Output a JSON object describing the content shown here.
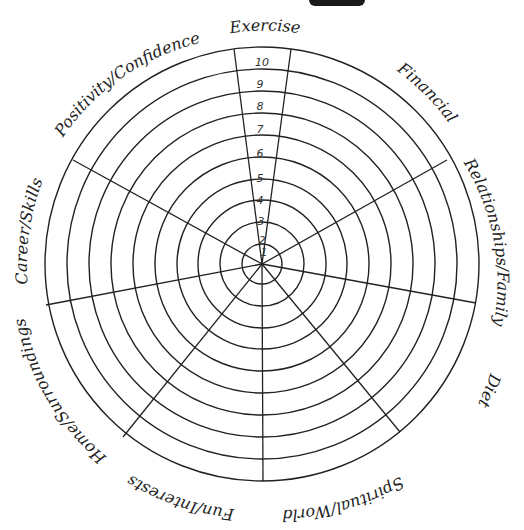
{
  "diagram": {
    "type": "wheel-of-life",
    "center": {
      "x": 262,
      "y": 264
    },
    "outer_radius": 217,
    "ring_count": 10,
    "scale_labels": [
      "1",
      "2",
      "3",
      "4",
      "5",
      "6",
      "7",
      "8",
      "9",
      "10"
    ],
    "categories": [
      {
        "label": "Exercise"
      },
      {
        "label": "Financial"
      },
      {
        "label": "Relationships/Family"
      },
      {
        "label": "Diet"
      },
      {
        "label": "Spiritual/World"
      },
      {
        "label": "Fun/Interests"
      },
      {
        "label": "Home/Surroundings"
      },
      {
        "label": "Career/Skills"
      },
      {
        "label": "Positivity/Confidence"
      }
    ],
    "colors": {
      "line": "#222222",
      "background": "#ffffff"
    }
  }
}
